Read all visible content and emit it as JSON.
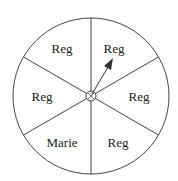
{
  "diagram": {
    "type": "spinner",
    "sectors": [
      {
        "label": "Reg",
        "position": "top-right"
      },
      {
        "label": "Reg",
        "position": "right"
      },
      {
        "label": "Reg",
        "position": "bottom-right"
      },
      {
        "label": "Marie",
        "position": "bottom-left"
      },
      {
        "label": "Reg",
        "position": "left"
      },
      {
        "label": "Reg",
        "position": "top-left"
      }
    ],
    "pointer": {
      "points_to": "top-right sector"
    },
    "colors": {
      "line": "#333333",
      "background": "#ffffff"
    }
  }
}
